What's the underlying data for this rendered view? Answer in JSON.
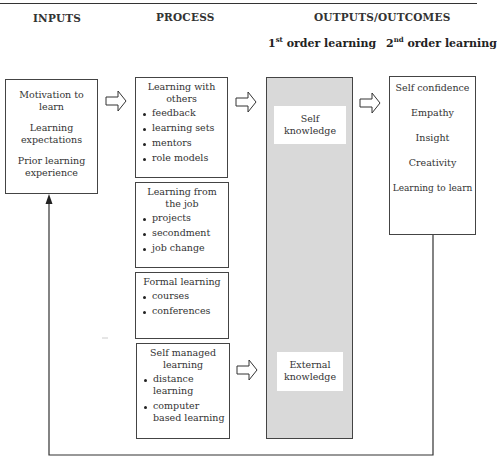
{
  "caption_fragment": "Figure ... learning p...",
  "headers": {
    "inputs": "INPUTS",
    "process": "PROCESS",
    "outputs": "OUTPUTS/OUTCOMES",
    "first_order": {
      "num": "1",
      "sup": "st",
      "text": " order learning"
    },
    "second_order": {
      "num": "2",
      "sup": "nd",
      "text": " order learning"
    }
  },
  "inputs": {
    "items": [
      "Motivation to learn",
      "Learning expectations",
      "Prior learning experience"
    ]
  },
  "process": {
    "groups": [
      {
        "title": "Learning with others",
        "bullets": [
          "feedback",
          "learning sets",
          "mentors",
          "role models"
        ]
      },
      {
        "title": "Learning from the job",
        "bullets": [
          "projects",
          "secondment",
          "job change"
        ]
      },
      {
        "title": "Formal learning",
        "bullets": [
          "courses",
          "conferences"
        ]
      },
      {
        "title": "Self managed learning",
        "bullets": [
          "distance learning",
          "computer based learning"
        ]
      }
    ]
  },
  "first_order": {
    "items": [
      "Self knowledge",
      "External knowledge"
    ],
    "fill_color": "#d9d9d9"
  },
  "second_order": {
    "items": [
      "Self confidence",
      "Empathy",
      "Insight",
      "Creativity",
      "Learning to learn"
    ]
  },
  "connectors": {
    "arrows": [
      "inputs-to-process",
      "learning-with-others-to-self-knowledge",
      "self-knowledge-to-second-order",
      "self-managed-to-external-knowledge"
    ],
    "feedback_loop": "second-order-to-inputs"
  }
}
